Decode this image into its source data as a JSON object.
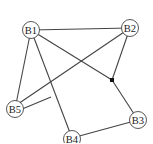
{
  "diagram": {
    "nodes": [
      {
        "id": "B1",
        "label": "B1",
        "x": 31,
        "y": 30
      },
      {
        "id": "B2",
        "label": "B2",
        "x": 130,
        "y": 28
      },
      {
        "id": "B3",
        "label": "B3",
        "x": 138,
        "y": 120
      },
      {
        "id": "B4",
        "label": "B4",
        "x": 72,
        "y": 138
      },
      {
        "id": "B5",
        "label": "B5",
        "x": 15,
        "y": 109
      }
    ],
    "junctions": [
      {
        "id": "J1",
        "x": 112,
        "y": 80
      },
      {
        "id": "J2",
        "x": 51,
        "y": 97
      }
    ],
    "edges": [
      [
        "B1",
        "B2"
      ],
      [
        "B1",
        "J1"
      ],
      [
        "B2",
        "J1"
      ],
      [
        "J1",
        "B3"
      ],
      [
        "B1",
        "B5"
      ],
      [
        "B1",
        "B4"
      ],
      [
        "B2",
        "B5"
      ],
      [
        "B5",
        "J2"
      ],
      [
        "B4",
        "B3"
      ]
    ]
  }
}
